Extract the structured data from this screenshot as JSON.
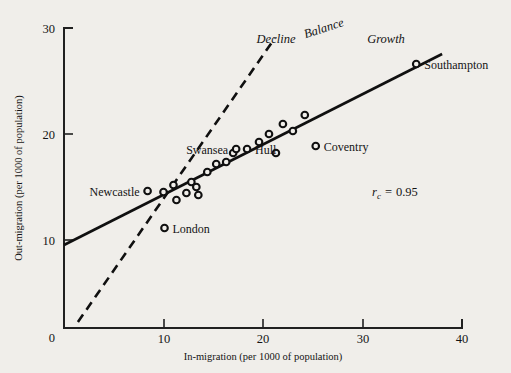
{
  "chart_data": {
    "type": "scatter",
    "title": "",
    "xlabel": "In-migration (per 1000 of population)",
    "ylabel": "Out-migration (per 1000 of population)",
    "xlim": [
      0,
      40
    ],
    "ylim": [
      0,
      30
    ],
    "xticks": [
      0,
      10,
      20,
      30,
      40
    ],
    "yticks": [
      0,
      10,
      20,
      30
    ],
    "xticklabels": [
      "0",
      "10",
      "20",
      "30",
      "40"
    ],
    "yticklabels": [
      "0",
      "10",
      "20",
      "30"
    ],
    "grid": false,
    "legend": "none",
    "points": [
      {
        "x": 8.4,
        "y": 13.7,
        "label": "Newcastle",
        "label_side": "left"
      },
      {
        "x": 10.0,
        "y": 13.6,
        "label": "",
        "label_side": ""
      },
      {
        "x": 11.0,
        "y": 14.3,
        "label": "",
        "label_side": ""
      },
      {
        "x": 11.3,
        "y": 12.8,
        "label": "",
        "label_side": ""
      },
      {
        "x": 12.3,
        "y": 13.5,
        "label": "",
        "label_side": ""
      },
      {
        "x": 12.8,
        "y": 14.6,
        "label": "",
        "label_side": ""
      },
      {
        "x": 13.3,
        "y": 14.1,
        "label": "",
        "label_side": ""
      },
      {
        "x": 13.5,
        "y": 13.3,
        "label": "",
        "label_side": ""
      },
      {
        "x": 14.4,
        "y": 15.6,
        "label": "",
        "label_side": ""
      },
      {
        "x": 15.3,
        "y": 16.4,
        "label": "",
        "label_side": ""
      },
      {
        "x": 16.3,
        "y": 16.6,
        "label": "",
        "label_side": ""
      },
      {
        "x": 17.0,
        "y": 17.5,
        "label": "",
        "label_side": ""
      },
      {
        "x": 17.3,
        "y": 17.9,
        "label": "Swansea",
        "label_side": "left"
      },
      {
        "x": 18.4,
        "y": 17.9,
        "label": "Hull",
        "label_side": "right"
      },
      {
        "x": 19.6,
        "y": 18.6,
        "label": "",
        "label_side": ""
      },
      {
        "x": 20.6,
        "y": 19.4,
        "label": "",
        "label_side": ""
      },
      {
        "x": 21.3,
        "y": 17.5,
        "label": "",
        "label_side": ""
      },
      {
        "x": 22.0,
        "y": 20.4,
        "label": "",
        "label_side": ""
      },
      {
        "x": 23.0,
        "y": 19.7,
        "label": "",
        "label_side": ""
      },
      {
        "x": 24.2,
        "y": 21.3,
        "label": "",
        "label_side": ""
      },
      {
        "x": 25.3,
        "y": 18.2,
        "label": "Coventry",
        "label_side": "right"
      },
      {
        "x": 35.4,
        "y": 26.4,
        "label": "Southampton",
        "label_side": "right"
      },
      {
        "x": 10.1,
        "y": 10.0,
        "label": "London",
        "label_side": "right"
      }
    ],
    "lines": [
      {
        "name": "regression",
        "style": "solid",
        "from": [
          0.0,
          8.3
        ],
        "to": [
          38.0,
          27.4
        ]
      },
      {
        "name": "balance",
        "style": "dashed",
        "from": [
          1.4,
          0.6
        ],
        "to": [
          21.2,
          29.0
        ]
      }
    ],
    "annotations": [
      {
        "name": "decline",
        "text": "Decline",
        "x": 21.3,
        "y": 28.3
      },
      {
        "name": "balance",
        "text": "Balance",
        "x": 26.2,
        "y": 29.5
      },
      {
        "name": "growth",
        "text": "Growth",
        "x": 32.3,
        "y": 28.3
      }
    ],
    "statistic": {
      "symbol": "r",
      "subscript": "c",
      "equals": "=",
      "value": "0.95",
      "x": 31.6,
      "y": 15.0
    }
  }
}
